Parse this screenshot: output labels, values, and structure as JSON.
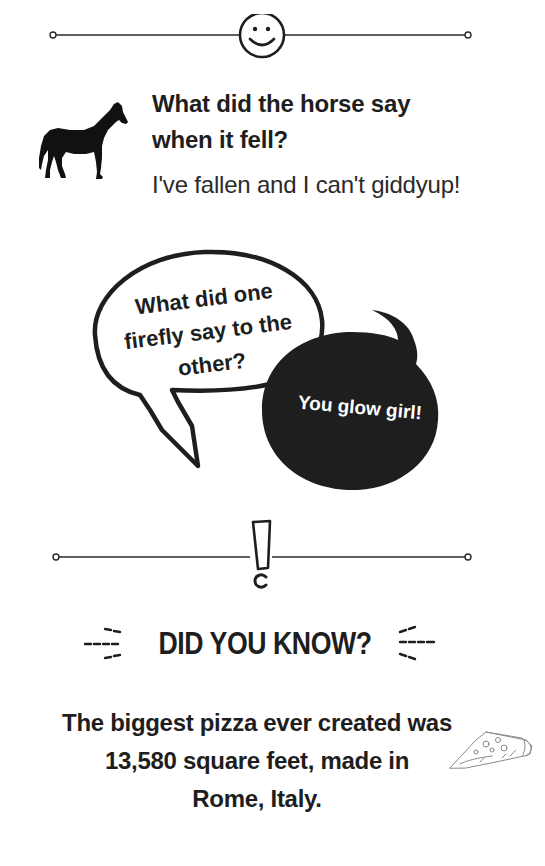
{
  "top_divider": {
    "icon": "smiley-face-icon"
  },
  "horse_joke": {
    "icon": "horse-silhouette-icon",
    "question_line1": "What did the horse say",
    "question_line2": "when it fell?",
    "answer": "I've fallen and I can't giddyup!"
  },
  "firefly_joke": {
    "question_line1": "What did one",
    "question_line2": "firefly say to the",
    "question_line3": "other?",
    "answer": "You glow girl!",
    "question_bubble_color": "#ffffff",
    "answer_bubble_color": "#1e1e1e"
  },
  "middle_divider": {
    "icon": "exclamation-mark-icon"
  },
  "did_you_know": {
    "title": "DID YOU KNOW?",
    "fact_line1": "The biggest pizza ever created was",
    "fact_line2": "13,580 square feet, made in",
    "fact_line3": "Rome, Italy.",
    "icon": "pizza-slice-icon"
  },
  "colors": {
    "ink": "#1e1e1e",
    "background": "#ffffff"
  }
}
